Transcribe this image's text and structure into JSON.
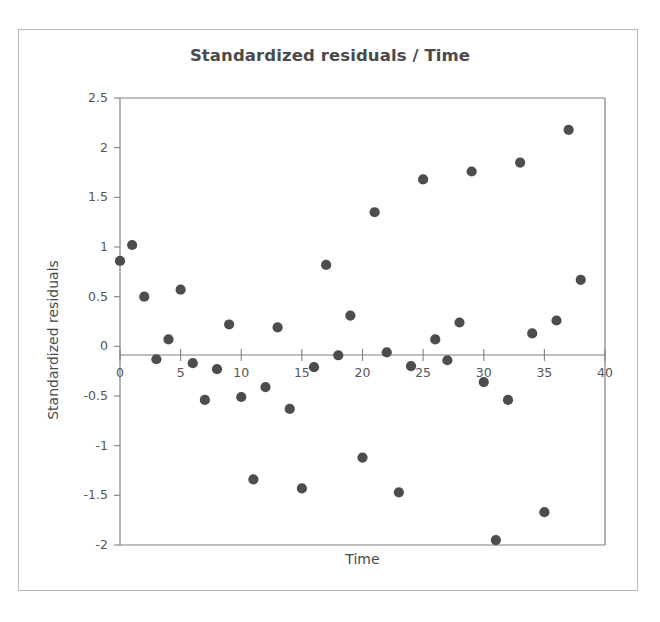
{
  "figure": {
    "title": "Standardized residuals / Time",
    "x_axis_title": "Time",
    "y_axis_title": "Standardized residuals",
    "background_color": "#ffffff",
    "border_color": "#b9b9b9",
    "axis_color": "#808080",
    "marker_color": "#4d4d4d",
    "title_color": "#4a4a4a"
  },
  "chart_data": {
    "type": "scatter",
    "title": "Standardized residuals / Time",
    "xlabel": "Time",
    "ylabel": "Standardized residuals",
    "xlim": [
      0,
      40
    ],
    "ylim": [
      -2,
      2.5
    ],
    "grid": false,
    "legend": null,
    "xticks": [
      0,
      5,
      10,
      15,
      20,
      25,
      30,
      35,
      40
    ],
    "xtick_labels": [
      "0",
      "5",
      "10",
      "15",
      "20",
      "25",
      "30",
      "35",
      "40"
    ],
    "yticks": [
      -2,
      -1.5,
      -1,
      -0.5,
      0,
      0.5,
      1,
      1.5,
      2,
      2.5
    ],
    "ytick_labels": [
      "-2",
      "-1.5",
      "-1",
      "-0.5",
      "0",
      "0.5",
      "1",
      "1.5",
      "2",
      "2.5"
    ],
    "series": [
      {
        "name": "Standardized residuals",
        "marker": "circle",
        "color": "#4d4d4d",
        "x": [
          0,
          1,
          2,
          3,
          4,
          5,
          6,
          7,
          8,
          9,
          10,
          11,
          12,
          13,
          14,
          15,
          16,
          17,
          18,
          19,
          20,
          21,
          22,
          23,
          24,
          25,
          26,
          27,
          28,
          29,
          30,
          31,
          32,
          33,
          34,
          35,
          36,
          37,
          38
        ],
        "y": [
          0.86,
          1.02,
          0.5,
          -0.13,
          0.07,
          0.57,
          -0.17,
          -0.54,
          -0.23,
          0.22,
          -0.51,
          -1.34,
          -0.41,
          0.19,
          -0.63,
          -1.43,
          -0.21,
          0.82,
          -0.09,
          0.31,
          -1.12,
          1.35,
          -0.06,
          -1.47,
          -0.2,
          1.68,
          0.07,
          -0.14,
          0.24,
          1.76,
          -0.36,
          -1.95,
          -0.54,
          1.85,
          0.13,
          -1.67,
          0.26,
          2.18,
          0.67
        ]
      }
    ]
  },
  "axes_geometry": {
    "plot_left_px": 120,
    "plot_right_px": 605,
    "plot_top_px": 98,
    "plot_bottom_px": 545,
    "zero_line_y_px": 355
  }
}
